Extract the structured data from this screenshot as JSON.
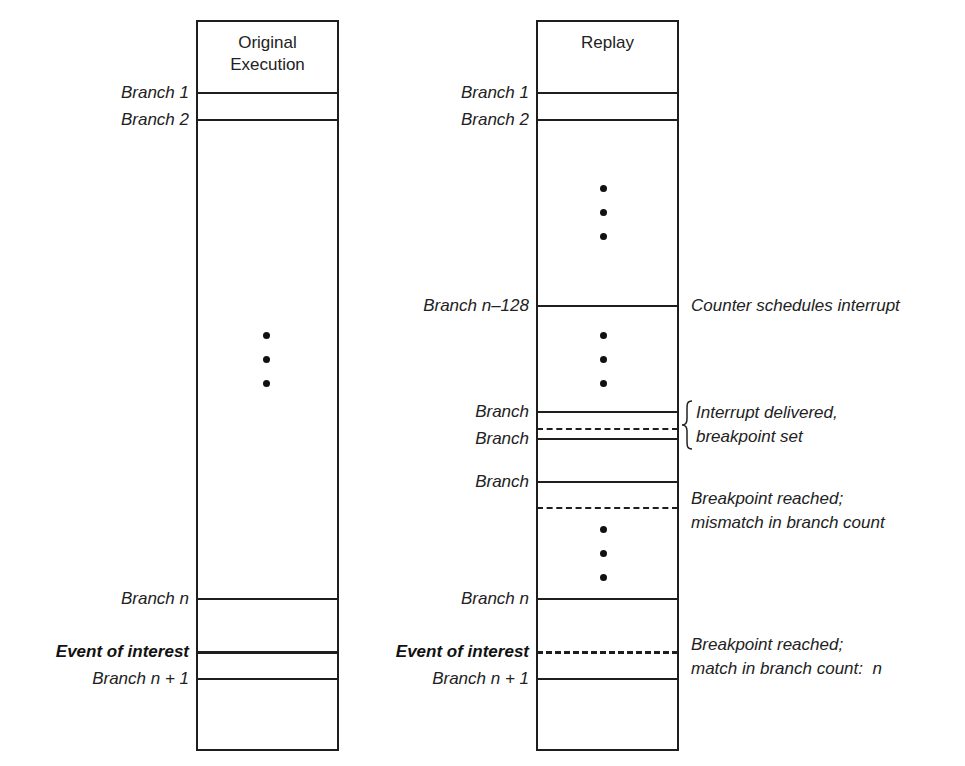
{
  "diagram": {
    "type": "execution-timeline-comparison",
    "columns": [
      {
        "id": "original",
        "title_lines": [
          "Original",
          "Execution"
        ],
        "markers": [
          {
            "label": "Branch 1",
            "y": 93,
            "style": "solid"
          },
          {
            "label": "Branch 2",
            "y": 120,
            "style": "solid"
          },
          {
            "label": "Branch n",
            "y": 599,
            "style": "solid"
          },
          {
            "label": "Event of interest",
            "y": 652,
            "style": "thick",
            "bold": true
          },
          {
            "label": "Branch n + 1",
            "y": 679,
            "style": "solid"
          }
        ],
        "ellipses": [
          {
            "y": 335
          }
        ]
      },
      {
        "id": "replay",
        "title_lines": [
          "Replay"
        ],
        "markers": [
          {
            "label": "Branch 1",
            "y": 93,
            "style": "solid"
          },
          {
            "label": "Branch 2",
            "y": 120,
            "style": "solid"
          },
          {
            "label": "Branch n–128",
            "y": 306,
            "style": "solid"
          },
          {
            "label": "Branch",
            "y": 412,
            "style": "solid"
          },
          {
            "label": "",
            "y": 429,
            "style": "dashed"
          },
          {
            "label": "Branch",
            "y": 439,
            "style": "solid"
          },
          {
            "label": "Branch",
            "y": 482,
            "style": "solid"
          },
          {
            "label": "",
            "y": 508,
            "style": "dashed"
          },
          {
            "label": "Branch n",
            "y": 599,
            "style": "solid"
          },
          {
            "label": "Event of interest",
            "y": 652,
            "style": "dotted-thick",
            "bold": true
          },
          {
            "label": "Branch n + 1",
            "y": 679,
            "style": "solid"
          }
        ],
        "ellipses": [
          {
            "y": 189
          },
          {
            "y": 336
          },
          {
            "y": 530
          }
        ]
      }
    ],
    "annotations": [
      {
        "id": "counter-schedules",
        "lines": [
          "Counter schedules interrupt"
        ]
      },
      {
        "id": "interrupt-delivered",
        "lines": [
          "Interrupt delivered,",
          "breakpoint set"
        ],
        "brace": true
      },
      {
        "id": "breakpoint-mismatch",
        "lines": [
          "Breakpoint reached;",
          "mismatch in branch count"
        ]
      },
      {
        "id": "breakpoint-match",
        "lines": [
          "Breakpoint reached;",
          "match in branch count:  n"
        ]
      }
    ]
  },
  "text": {
    "orig_title_1": "Original",
    "orig_title_2": "Execution",
    "replay_title": "Replay",
    "orig_branch1": "Branch 1",
    "orig_branch2": "Branch 2",
    "orig_branchn": "Branch n",
    "orig_event": "Event of interest",
    "orig_branchn1": "Branch n + 1",
    "rep_branch1": "Branch 1",
    "rep_branch2": "Branch 2",
    "rep_branchn128": "Branch n–128",
    "rep_branch_a": "Branch",
    "rep_branch_b": "Branch",
    "rep_branch_c": "Branch",
    "rep_branchn": "Branch n",
    "rep_event": "Event of interest",
    "rep_branchn1": "Branch n + 1",
    "note_counter": "Counter schedules interrupt",
    "note_interrupt_1": "Interrupt delivered,",
    "note_interrupt_2": "breakpoint set",
    "note_mismatch_1": "Breakpoint reached;",
    "note_mismatch_2": "mismatch in branch count",
    "note_match_1": "Breakpoint reached;",
    "note_match_2": "match in branch count:  n"
  },
  "colors": {
    "line": "#1e1e1e",
    "text": "#222222",
    "background": "#ffffff"
  }
}
